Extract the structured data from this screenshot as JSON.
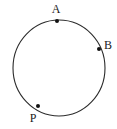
{
  "figure": {
    "type": "geometry-diagram",
    "background_color": "#ffffff",
    "stroke_color": "#2b2b2b",
    "point_color": "#111111",
    "label_color": "#1a1a1a",
    "circle": {
      "name": "circle",
      "center_x": 59,
      "center_y": 68,
      "radius_x": 46,
      "radius_y": 48,
      "stroke_width": 1.1,
      "fill": "none"
    },
    "points": [
      {
        "id": "A",
        "label": "A",
        "dot_x": 57,
        "dot_y": 21,
        "dot_radius": 2.0,
        "label_x": 56,
        "label_y": 9
      },
      {
        "id": "B",
        "label": "B",
        "dot_x": 99,
        "dot_y": 49,
        "dot_radius": 2.0,
        "label_x": 108,
        "label_y": 45
      },
      {
        "id": "P",
        "label": "P",
        "dot_x": 38,
        "dot_y": 106,
        "dot_radius": 2.0,
        "label_x": 33,
        "label_y": 118
      }
    ]
  }
}
